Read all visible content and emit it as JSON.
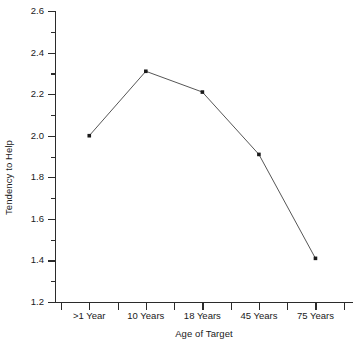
{
  "chart_data": {
    "type": "line",
    "title": "",
    "subtitle": "",
    "xlabel": "Age of Target",
    "ylabel": "Tendency to Help",
    "categories": [
      ">1 Year",
      "10 Years",
      "18 Years",
      "45 Years",
      "75 Years"
    ],
    "values": [
      2.0,
      2.31,
      2.21,
      1.91,
      1.41
    ],
    "series": [
      {
        "name": "Tendency to Help",
        "values": [
          2.0,
          2.31,
          2.21,
          1.91,
          1.41
        ]
      }
    ],
    "ylim": [
      1.2,
      2.6
    ],
    "ytick_labels": [
      "1.2",
      "1.4",
      "1.6",
      "1.8",
      "2.0",
      "2.2",
      "2.4",
      "2.6"
    ],
    "ytick_values": [
      1.2,
      1.4,
      1.6,
      1.8,
      2.0,
      2.2,
      2.4,
      2.6
    ],
    "yminor_values": [
      1.3,
      1.5,
      1.7,
      1.9,
      2.1,
      2.3,
      2.5
    ],
    "grid": false,
    "legend": false,
    "legend_position": "none",
    "marker": "square",
    "line_color": "#565656",
    "marker_color": "#1a1a1a",
    "axis_color": "#2b2b2b",
    "background_color": "#ffffff",
    "annotations": []
  }
}
